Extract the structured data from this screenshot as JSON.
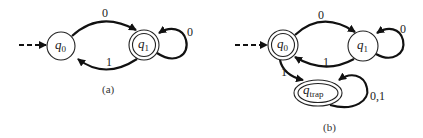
{
  "diagrams": [
    {
      "caption": "(a)",
      "states": [
        {
          "id": "q0",
          "name": "q",
          "subscript": "0",
          "start": true,
          "accepting": false
        },
        {
          "id": "q1",
          "name": "q",
          "subscript": "1",
          "start": false,
          "accepting": true
        }
      ],
      "transitions": [
        {
          "from": "q0",
          "to": "q1",
          "label": "0"
        },
        {
          "from": "q1",
          "to": "q0",
          "label": "1"
        },
        {
          "from": "q1",
          "to": "q1",
          "label": "0"
        }
      ]
    },
    {
      "caption": "(b)",
      "states": [
        {
          "id": "q0",
          "name": "q",
          "subscript": "0",
          "start": true,
          "accepting": true
        },
        {
          "id": "q1",
          "name": "q",
          "subscript": "1",
          "start": false,
          "accepting": false
        },
        {
          "id": "qtrap",
          "name": "q",
          "subscript": "trap",
          "start": false,
          "accepting": true
        }
      ],
      "transitions": [
        {
          "from": "q0",
          "to": "q1",
          "label": "0"
        },
        {
          "from": "q1",
          "to": "q0",
          "label": "1"
        },
        {
          "from": "q1",
          "to": "q1",
          "label": "0"
        },
        {
          "from": "q0",
          "to": "qtrap",
          "label": "1"
        },
        {
          "from": "qtrap",
          "to": "qtrap",
          "label": "0,1"
        }
      ]
    }
  ]
}
